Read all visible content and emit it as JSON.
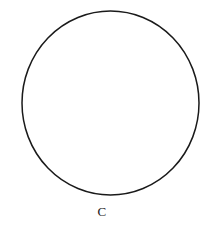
{
  "figure": {
    "background_color": "#ffffff",
    "stroke_color": "#1a1a1a",
    "label": "C",
    "label_color": "#1a1a1a"
  },
  "chart_data": {
    "type": "diagram",
    "title": "",
    "subtitle": "",
    "xlabel": "",
    "ylabel": "",
    "annotations": [
      "C"
    ],
    "legend": [],
    "grid": false,
    "shapes": [
      {
        "name": "circle",
        "kind": "ellipse",
        "center_x": 110.5,
        "center_y": 103,
        "radius_x": 88.5,
        "radius_y": 92,
        "stroke": "#1a1a1a",
        "stroke_width": 1.5,
        "fill": "none",
        "label": "C"
      }
    ],
    "canvas": {
      "width": 210,
      "height": 232
    }
  }
}
